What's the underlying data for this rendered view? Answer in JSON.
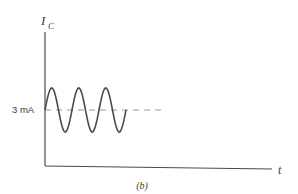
{
  "figure": {
    "y_axis_label": "I",
    "y_axis_subscript": "C",
    "x_axis_label": "t",
    "level_label": "3 mA",
    "caption": "(b)",
    "colors": {
      "stroke": "#4a4a4a",
      "dash": "#9a9a9a"
    }
  },
  "signal": {
    "description": "sinusoidal collector current oscillating about 3 mA DC level",
    "dc_level_mA": 3,
    "cycles": 3,
    "ends_at_phase": "return to DC level after third trough",
    "dc_line_style": "dashed continuation"
  }
}
